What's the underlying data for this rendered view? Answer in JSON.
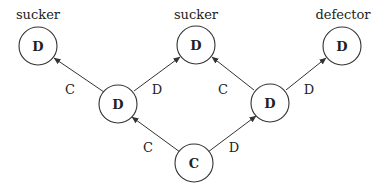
{
  "diagram": {
    "type": "game-tree",
    "nodes": [
      {
        "id": "root",
        "label": "C",
        "x": 194,
        "y": 163
      },
      {
        "id": "mid-left",
        "label": "D",
        "x": 118,
        "y": 104
      },
      {
        "id": "mid-right",
        "label": "D",
        "x": 270,
        "y": 103
      },
      {
        "id": "leaf-left",
        "label": "D",
        "x": 38,
        "y": 46,
        "outcome": "sucker"
      },
      {
        "id": "leaf-middle",
        "label": "D",
        "x": 196,
        "y": 45,
        "outcome": "sucker"
      },
      {
        "id": "leaf-right",
        "label": "D",
        "x": 342,
        "y": 46,
        "outcome": "defector"
      }
    ],
    "edges": [
      {
        "from": "root",
        "to": "mid-left",
        "label": "C"
      },
      {
        "from": "root",
        "to": "mid-right",
        "label": "D"
      },
      {
        "from": "mid-left",
        "to": "leaf-left",
        "label": "C"
      },
      {
        "from": "mid-left",
        "to": "leaf-middle",
        "label": "D"
      },
      {
        "from": "mid-right",
        "to": "leaf-middle",
        "label": "C"
      },
      {
        "from": "mid-right",
        "to": "leaf-right",
        "label": "D"
      }
    ],
    "outcome_labels": {
      "leaf_left": "sucker",
      "leaf_middle": "sucker",
      "leaf_right": "defector"
    },
    "node_labels": {
      "root": "C",
      "mid_left": "D",
      "mid_right": "D",
      "leaf_left": "D",
      "leaf_middle": "D",
      "leaf_right": "D"
    },
    "edge_labels": {
      "root_to_mid_left": "C",
      "root_to_mid_right": "D",
      "mid_left_to_leaf_left": "C",
      "mid_left_to_leaf_middle": "D",
      "mid_right_to_leaf_middle": "C",
      "mid_right_to_leaf_right": "D"
    },
    "colors": {
      "stroke": "#333333",
      "text": "#222222",
      "background": "#ffffff"
    }
  }
}
